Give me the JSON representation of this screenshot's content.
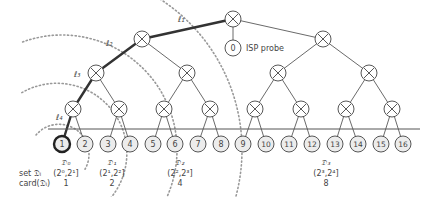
{
  "diagram": {
    "colors": {
      "edge": "#444444",
      "path": "#333333",
      "node_fill": "#ffffff",
      "leaf_fill": "#ececec",
      "dotted": "#999999",
      "text": "#444444"
    },
    "root": {
      "id": "root",
      "x": 233,
      "y": 19
    },
    "probe": {
      "id": "0",
      "label": "0",
      "x": 233,
      "y": 48,
      "caption": "ISP probe"
    },
    "level2": [
      {
        "x": 142,
        "y": 39
      },
      {
        "x": 323,
        "y": 39
      }
    ],
    "level3": [
      {
        "x": 96,
        "y": 73
      },
      {
        "x": 187,
        "y": 73
      },
      {
        "x": 278,
        "y": 73
      },
      {
        "x": 369,
        "y": 73
      }
    ],
    "level4": [
      {
        "x": 73,
        "y": 109
      },
      {
        "x": 119,
        "y": 109
      },
      {
        "x": 164,
        "y": 109
      },
      {
        "x": 210,
        "y": 109
      },
      {
        "x": 255,
        "y": 109
      },
      {
        "x": 301,
        "y": 109
      },
      {
        "x": 346,
        "y": 109
      },
      {
        "x": 392,
        "y": 109
      }
    ],
    "leaves": [
      {
        "label": "1",
        "x": 62
      },
      {
        "label": "2",
        "x": 85
      },
      {
        "label": "3",
        "x": 108
      },
      {
        "label": "4",
        "x": 130
      },
      {
        "label": "5",
        "x": 153
      },
      {
        "label": "6",
        "x": 175
      },
      {
        "label": "7",
        "x": 198
      },
      {
        "label": "8",
        "x": 221
      },
      {
        "label": "9",
        "x": 243
      },
      {
        "label": "10",
        "x": 266
      },
      {
        "label": "11",
        "x": 289
      },
      {
        "label": "12",
        "x": 312
      },
      {
        "label": "13",
        "x": 335
      },
      {
        "label": "14",
        "x": 358
      },
      {
        "label": "15",
        "x": 381
      },
      {
        "label": "16",
        "x": 403
      }
    ],
    "leaf_y": 144,
    "highlighted_leaf": "1",
    "path_labels": [
      {
        "text": "ℓ₁",
        "x": 178,
        "y": 22
      },
      {
        "text": "ℓ₂",
        "x": 106,
        "y": 46
      },
      {
        "text": "ℓ₃",
        "x": 74,
        "y": 77
      },
      {
        "text": "ℓ₄",
        "x": 56,
        "y": 120
      }
    ],
    "sets": [
      {
        "name": "𝔇₀",
        "interval": "(2⁰,2¹]",
        "card": "1",
        "x": 66
      },
      {
        "name": "𝔇₁",
        "interval": "(2¹,2²]",
        "card": "2",
        "x": 112
      },
      {
        "name": "𝔇₂",
        "interval": "(2²,2³]",
        "card": "4",
        "x": 180
      },
      {
        "name": "𝔇₃",
        "interval": "(2³,2⁴]",
        "card": "8",
        "x": 326
      }
    ],
    "row_labels": {
      "set": "set 𝔇ᵢ",
      "card": "card(𝔇ᵢ)"
    }
  }
}
